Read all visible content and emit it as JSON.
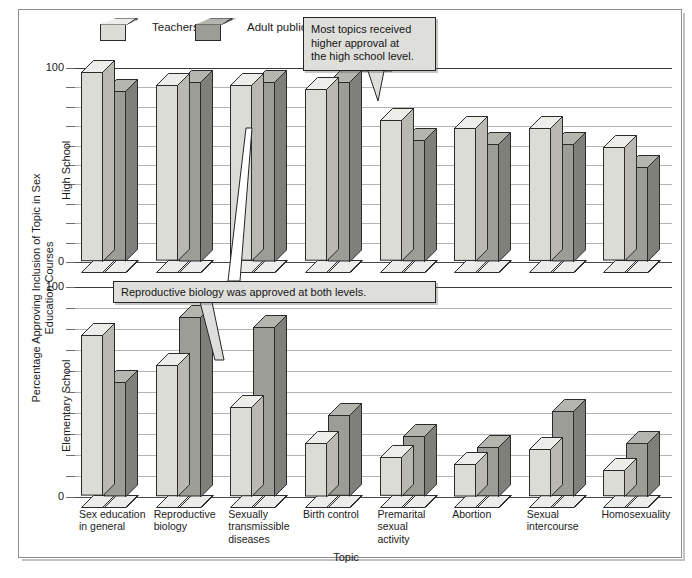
{
  "figure": {
    "y_axis_title": "Percentage Approving Inclusion of Topic in Sex Education Courses",
    "x_axis_title": "Topic",
    "panels": [
      {
        "id": "high-school",
        "label": "High School"
      },
      {
        "id": "elementary-school",
        "label": "Elementary School"
      }
    ],
    "axis_ticks": [
      "0",
      "100"
    ],
    "colors": {
      "teachers_front": "#dcdcd6",
      "teachers_top": "#ededea",
      "teachers_side": "#b9b9b2",
      "adult_front": "#9d9d98",
      "adult_top": "#b5b5b0",
      "adult_side": "#80807b",
      "gridline": "#b4b4b4",
      "axis": "#4a4a4a",
      "callout_bg": "#dededa",
      "frame": "#8e8e8e"
    }
  },
  "legend": {
    "items": [
      {
        "label": "Teachers",
        "key": "teachers"
      },
      {
        "label": "Adult public",
        "key": "adult_public"
      }
    ]
  },
  "annotations": [
    {
      "id": "hs-note",
      "text": "Most topics received higher approval at the high school level.",
      "lines": [
        "Most topics received",
        "higher approval at",
        "the high school level."
      ],
      "points_to": "Birth control - High School - Teachers"
    },
    {
      "id": "repro-note",
      "text": "Reproductive biology was approved at both levels.",
      "lines": [
        "Reproductive biology was approved at both levels."
      ],
      "points_to": "Reproductive biology - both panels - Teachers"
    }
  ],
  "chart_data": {
    "type": "bar",
    "title": "",
    "xlabel": "Topic",
    "ylabel": "Percentage Approving Inclusion of Topic in Sex Education Courses",
    "ylim": [
      0,
      100
    ],
    "ytick_interval": 10,
    "grid": true,
    "legend_position": "top-left",
    "categories": [
      "Sex education in general",
      "Reproductive biology",
      "Sexually transmissible diseases",
      "Birth control",
      "Premarital sexual activity",
      "Abortion",
      "Sexual intercourse",
      "Homosexuality"
    ],
    "category_lines": [
      [
        "Sex education",
        "in general"
      ],
      [
        "Reproductive",
        "biology"
      ],
      [
        "Sexually",
        "transmissible",
        "diseases"
      ],
      [
        "Birth control"
      ],
      [
        "Premarital",
        "sexual",
        "activity"
      ],
      [
        "Abortion"
      ],
      [
        "Sexual",
        "intercourse"
      ],
      [
        "Homosexuality"
      ]
    ],
    "panels": [
      {
        "name": "High School",
        "series": [
          {
            "name": "Teachers",
            "values": [
              97,
              90,
              90,
              88,
              72,
              68,
              68,
              58
            ]
          },
          {
            "name": "Adult public",
            "values": [
              87,
              92,
              92,
              92,
              62,
              60,
              60,
              48
            ]
          }
        ]
      },
      {
        "name": "Elementary School",
        "series": [
          {
            "name": "Teachers",
            "values": [
              76,
              62,
              42,
              25,
              18,
              15,
              22,
              12
            ]
          },
          {
            "name": "Adult public",
            "values": [
              54,
              85,
              80,
              38,
              28,
              23,
              40,
              25
            ]
          }
        ]
      }
    ]
  }
}
